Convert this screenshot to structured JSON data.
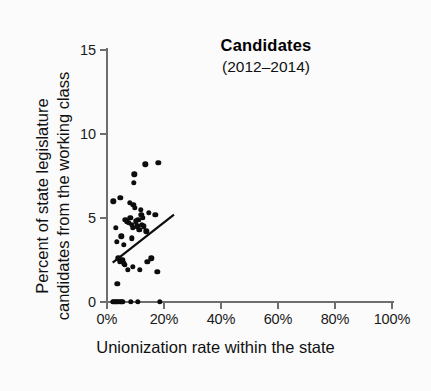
{
  "chart_data": {
    "type": "scatter",
    "title": "Candidates",
    "subtitle": "(2012–2014)",
    "xlabel": "Unionization rate within the state",
    "ylabel_line1": "Percent of state legislature",
    "ylabel_line2": "candidates from the working class",
    "xlim": [
      0,
      100
    ],
    "ylim": [
      0,
      15
    ],
    "xticks": [
      0,
      20,
      40,
      60,
      80,
      100
    ],
    "xtick_labels": [
      "0%",
      "20%",
      "40%",
      "60%",
      "80%",
      "100%"
    ],
    "yticks": [
      0,
      5,
      10,
      15
    ],
    "ytick_labels": [
      "0",
      "5",
      "10",
      "15"
    ],
    "grid": false,
    "legend": "none",
    "marker_color": "#0d0d0d",
    "axis_color": "#6e6e6e",
    "background_color": "#fbfbfb",
    "points": [
      {
        "x": 2.2,
        "y": 6.0
      },
      {
        "x": 4.6,
        "y": 6.2
      },
      {
        "x": 9.6,
        "y": 7.6
      },
      {
        "x": 9.4,
        "y": 7.1
      },
      {
        "x": 13.5,
        "y": 8.2
      },
      {
        "x": 18.0,
        "y": 8.3
      },
      {
        "x": 8.0,
        "y": 5.9
      },
      {
        "x": 9.2,
        "y": 5.8
      },
      {
        "x": 9.8,
        "y": 5.6
      },
      {
        "x": 11.8,
        "y": 5.5
      },
      {
        "x": 12.0,
        "y": 5.2
      },
      {
        "x": 12.6,
        "y": 5.0
      },
      {
        "x": 14.6,
        "y": 5.3
      },
      {
        "x": 17.0,
        "y": 5.2
      },
      {
        "x": 3.0,
        "y": 4.4
      },
      {
        "x": 6.4,
        "y": 4.9
      },
      {
        "x": 7.0,
        "y": 4.8
      },
      {
        "x": 7.6,
        "y": 4.7
      },
      {
        "x": 8.2,
        "y": 5.0
      },
      {
        "x": 8.6,
        "y": 4.6
      },
      {
        "x": 9.0,
        "y": 4.4
      },
      {
        "x": 10.2,
        "y": 4.8
      },
      {
        "x": 10.6,
        "y": 4.5
      },
      {
        "x": 11.0,
        "y": 4.9
      },
      {
        "x": 11.4,
        "y": 4.3
      },
      {
        "x": 12.2,
        "y": 4.6
      },
      {
        "x": 13.0,
        "y": 4.5
      },
      {
        "x": 13.8,
        "y": 4.2
      },
      {
        "x": 3.4,
        "y": 3.6
      },
      {
        "x": 5.0,
        "y": 3.9
      },
      {
        "x": 6.0,
        "y": 3.4
      },
      {
        "x": 8.8,
        "y": 3.8
      },
      {
        "x": 4.0,
        "y": 2.6
      },
      {
        "x": 4.4,
        "y": 2.4
      },
      {
        "x": 5.4,
        "y": 2.5
      },
      {
        "x": 5.8,
        "y": 2.3
      },
      {
        "x": 6.2,
        "y": 2.2
      },
      {
        "x": 9.0,
        "y": 2.1
      },
      {
        "x": 11.6,
        "y": 1.9
      },
      {
        "x": 14.2,
        "y": 2.4
      },
      {
        "x": 15.6,
        "y": 2.6
      },
      {
        "x": 17.6,
        "y": 1.8
      },
      {
        "x": 7.4,
        "y": 1.9
      },
      {
        "x": 3.6,
        "y": 1.1
      },
      {
        "x": 2.0,
        "y": 0.0
      },
      {
        "x": 2.6,
        "y": 0.0
      },
      {
        "x": 3.2,
        "y": 0.0
      },
      {
        "x": 3.8,
        "y": 0.0
      },
      {
        "x": 4.4,
        "y": 0.0
      },
      {
        "x": 5.0,
        "y": 0.0
      },
      {
        "x": 5.6,
        "y": 0.0
      },
      {
        "x": 8.4,
        "y": 0.0
      },
      {
        "x": 10.8,
        "y": 0.0
      },
      {
        "x": 18.6,
        "y": 0.0
      }
    ],
    "trend_line": {
      "x0": 2.0,
      "y0": 2.35,
      "x1": 23.5,
      "y1": 5.2,
      "color": "#0d0d0d",
      "width": 2.2
    }
  }
}
